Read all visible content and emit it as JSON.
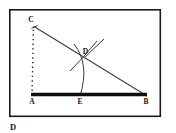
{
  "figure": {
    "kind": "geometry-construction-diagram",
    "caption": "D",
    "background_color": "#ffffff",
    "frame": {
      "stroke": "#1a1a1a",
      "stroke_width": 1.6,
      "x": 9,
      "y": 9,
      "width": 152,
      "height": 108
    },
    "labels": {
      "a": "A",
      "b": "B",
      "c": "C",
      "d": "D",
      "e": "E"
    },
    "points": {
      "A": {
        "x": 32,
        "y": 97
      },
      "B": {
        "x": 146,
        "y": 97
      },
      "C": {
        "x": 34,
        "y": 25
      },
      "D": {
        "x": 85,
        "y": 55
      },
      "E": {
        "x": 80,
        "y": 97
      }
    },
    "segments": {
      "base_AB": {
        "label": "AB",
        "stroke": "#0d0d0d",
        "stroke_width": 3.6
      },
      "hypotenuse_CB": {
        "label": "CB",
        "stroke": "#3a3a3a",
        "stroke_width": 1.1
      },
      "dotted_CA": {
        "label": "CA",
        "stroke": "#2a2a2a",
        "stroke_width": 1.3,
        "dash": "1.4 3.2"
      }
    },
    "construction": {
      "arc_through_D": {
        "stroke": "#3a3a3a",
        "stroke_width": 1.0
      },
      "arc_cross_lower": {
        "stroke": "#3a3a3a",
        "stroke_width": 1.0
      },
      "ray_from_D": {
        "stroke": "#3a3a3a",
        "stroke_width": 1.0
      },
      "tick_at_C": {
        "stroke": "#3a3a3a",
        "stroke_width": 1.0
      }
    }
  }
}
